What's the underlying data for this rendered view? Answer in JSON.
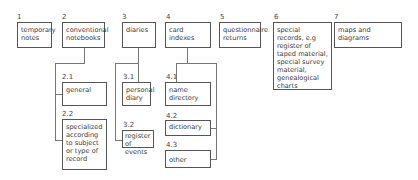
{
  "diagram": {
    "type": "hierarchy",
    "categories": [
      {
        "id": "1",
        "label": "temporary notes"
      },
      {
        "id": "2",
        "label": "conventional notebooks",
        "children": [
          {
            "id": "2.1",
            "label": "general"
          },
          {
            "id": "2.2",
            "label": "specialized according to subject or type of record"
          }
        ]
      },
      {
        "id": "3",
        "label": "diaries",
        "children": [
          {
            "id": "3.1",
            "label": "personal diary"
          },
          {
            "id": "3.2",
            "label": "register of events"
          }
        ]
      },
      {
        "id": "4",
        "label": "card indexes",
        "children": [
          {
            "id": "4.1",
            "label": "name directory"
          },
          {
            "id": "4.2",
            "label": "dictionary"
          },
          {
            "id": "4.3",
            "label": "other"
          }
        ]
      },
      {
        "id": "5",
        "label": "questionnaire returns"
      },
      {
        "id": "6",
        "label": "special records, e.g register of taped material, special survey material, genealogical charts"
      },
      {
        "id": "7",
        "label": "maps and diagrams"
      }
    ]
  },
  "n": {
    "c1": "1",
    "c2": "2",
    "c3": "3",
    "c4": "4",
    "c5": "5",
    "c6": "6",
    "c7": "7",
    "c21": "2.1",
    "c22": "2.2",
    "c31": "3.1",
    "c32": "3.2",
    "c41": "4.1",
    "c42": "4.2",
    "c43": "4.3"
  },
  "t": {
    "c1": "temporary notes",
    "c2": "conventional notebooks",
    "c3": "diaries",
    "c4": "card indexes",
    "c5": "questionnaire returns",
    "c6": "special records, e.g register of taped material, special survey material, genealogical charts",
    "c7": "maps and diagrams",
    "c21": "general",
    "c22": "specialized according to subject or type of record",
    "c31": "personal diary",
    "c32": "register of events",
    "c41": "name directory",
    "c42": "dictionary",
    "c43": "other"
  }
}
